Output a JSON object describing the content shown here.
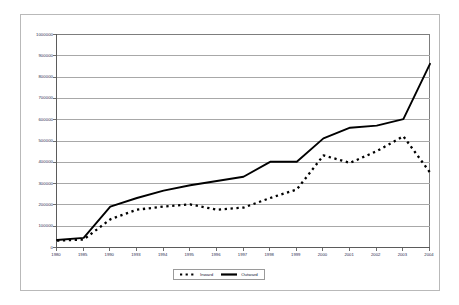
{
  "chart_data": {
    "type": "line",
    "title": "",
    "subtitle": "",
    "xlabel": "",
    "ylabel": "",
    "categories": [
      "1980",
      "1985",
      "1990",
      "1993",
      "1994",
      "1995",
      "1996",
      "1997",
      "1998",
      "1999",
      "2000",
      "2001",
      "2002",
      "2003",
      "2004"
    ],
    "ylim": [
      0,
      1000000
    ],
    "ytick_labels": [
      "1000000",
      "900000",
      "800000",
      "700000",
      "600000",
      "500000",
      "400000",
      "300000",
      "200000",
      "100000",
      "0"
    ],
    "ytick_values": [
      1000000,
      900000,
      800000,
      700000,
      600000,
      500000,
      400000,
      300000,
      200000,
      100000,
      0
    ],
    "grid": true,
    "legend_position": "bottom",
    "series": [
      {
        "name": "Inward",
        "style": "dashed",
        "color": "#000000",
        "values": [
          30000,
          35000,
          130000,
          175000,
          190000,
          200000,
          175000,
          185000,
          230000,
          270000,
          430000,
          395000,
          450000,
          520000,
          350000
        ]
      },
      {
        "name": "Outward",
        "style": "solid",
        "color": "#000000",
        "values": [
          33000,
          43000,
          190000,
          230000,
          265000,
          290000,
          310000,
          330000,
          400000,
          400000,
          510000,
          560000,
          570000,
          600000,
          860000
        ]
      }
    ]
  },
  "legend": {
    "entries": [
      {
        "label": "Inward",
        "marker": "dashed-line-marker"
      },
      {
        "label": "Outward",
        "marker": "solid-line-marker"
      }
    ]
  }
}
